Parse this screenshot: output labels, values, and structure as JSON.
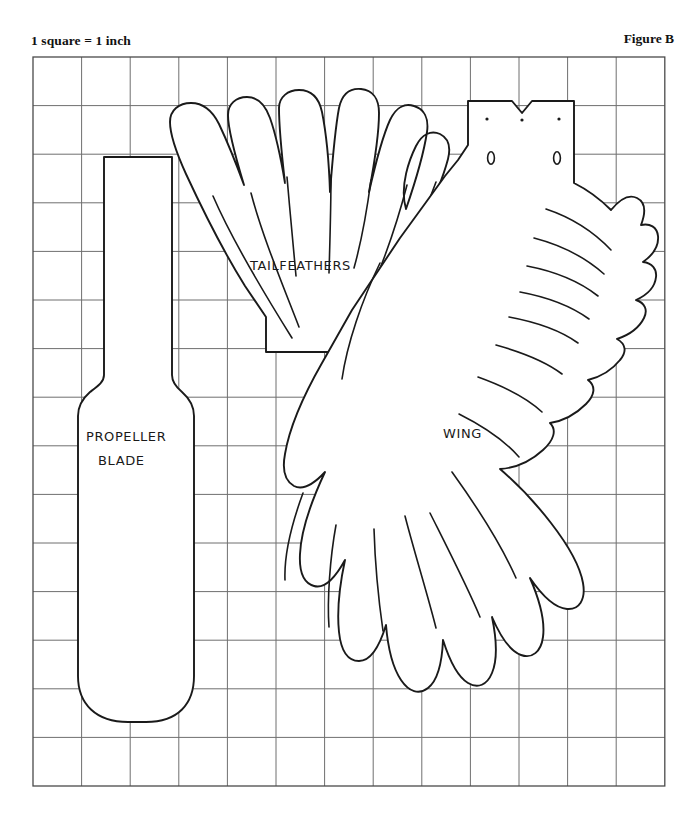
{
  "figure": {
    "scale_note": "1 square = 1 inch",
    "figure_label": "Figure B"
  },
  "grid": {
    "x": 33,
    "y": 57,
    "cell_size": 48.6,
    "cols": 13,
    "rows": 15,
    "line_color": "#6f6f6f",
    "border_color": "#4a4a4a"
  },
  "pieces": [
    {
      "id": "propeller-blade",
      "label_line1": "PROPELLER",
      "label_line2": "BLADE",
      "label_x": 86,
      "label_y": 441,
      "label_x2": 98,
      "label_y2": 465,
      "outline_color": "#1a1a1a"
    },
    {
      "id": "tailfeathers",
      "label": "TAILFEATHERS",
      "label_x": 250,
      "label_y": 270,
      "lobes": 7,
      "outline_color": "#1a1a1a"
    },
    {
      "id": "wing",
      "label": "WING",
      "label_x": 443,
      "label_y": 438,
      "hole_marks": 2,
      "dot_marks": 3,
      "outline_color": "#1a1a1a"
    }
  ]
}
